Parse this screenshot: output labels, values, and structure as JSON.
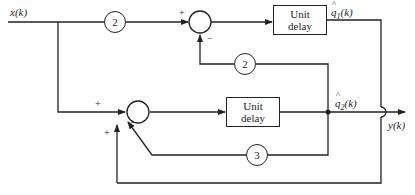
{
  "diagram": {
    "type": "block-diagram",
    "input": {
      "label": "x(k)"
    },
    "output": {
      "label": "y(k)"
    },
    "states": [
      {
        "id": "q1",
        "label_main": "q",
        "label_sub": "1",
        "label_arg": "(k)"
      },
      {
        "id": "q2",
        "label_main": "q",
        "label_sub": "2",
        "label_arg": "(k)"
      }
    ],
    "blocks": [
      {
        "id": "delay1",
        "line1": "Unit",
        "line2": "delay"
      },
      {
        "id": "delay2",
        "line1": "Unit",
        "line2": "delay"
      }
    ],
    "gains": [
      {
        "id": "gain-input",
        "value": "2"
      },
      {
        "id": "gain-feedback-q2-to-top",
        "value": "2"
      },
      {
        "id": "gain-feedback-q2-to-bottom",
        "value": "3"
      }
    ],
    "summers": [
      {
        "id": "sum-top",
        "signs": [
          "+",
          "−"
        ]
      },
      {
        "id": "sum-bottom",
        "signs": [
          "+",
          "−",
          "+"
        ]
      }
    ],
    "connections": [
      "x(k) -> gain 2 -> sum-top (+)",
      "q2 -> gain 2 -> sum-top (−)",
      "sum-top -> delay1 -> q1",
      "x(k) -> sum-bottom (+)",
      "q2 -> gain 3 -> sum-bottom (−)",
      "q1 -> sum-bottom (+)",
      "sum-bottom -> delay2 -> q2",
      "q2 -> y(k)"
    ]
  }
}
